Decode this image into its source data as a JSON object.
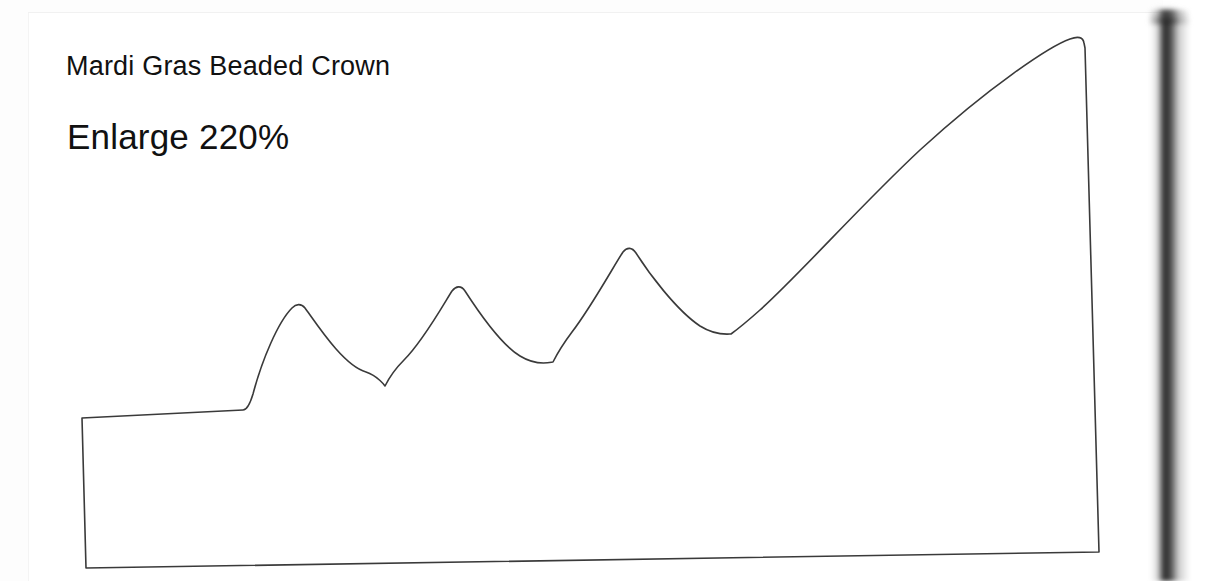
{
  "document": {
    "type": "scanned-pattern-page",
    "background_color": "#ffffff",
    "ink_color": "#3a3a3a",
    "text_color": "#111111"
  },
  "captions": {
    "title": "Mardi Gras Beaded Crown",
    "enlarge": "Enlarge 220%"
  },
  "pattern": {
    "name": "beaded-crown-outline",
    "description": "Crown template outline with three rounded points and a tall rising right side",
    "stroke_color": "#3a3a3a",
    "fill_color": "#ffffff",
    "path": "M 82 418 L 243 410 C 247 410 250 404 253 394 C 262 360 278 322 292 308 C 296 304 301 303 305 308 C 318 326 344 366 366 372 C 378 376 385 386 385 386 C 385 386 392 372 404 360 C 424 340 446 300 452 291 C 456 286 461 285 465 291 C 476 308 500 344 520 356 C 538 367 551 362 553 362 C 553 362 560 348 572 332 C 592 306 616 262 623 252 C 627 247 632 247 636 253 C 648 272 676 310 700 326 C 716 336 728 334 731 334 C 731 334 742 326 760 310 C 800 274 860 206 920 150 C 990 86 1050 46 1070 39 C 1078 36 1083 37 1084 43 L 1085 48 L 1099 552 L 86 568 Z",
    "anchors": {
      "top_left": [
        82,
        418
      ],
      "ledge_right": [
        243,
        410
      ],
      "peak_1": [
        300,
        304
      ],
      "valley_1": [
        385,
        386
      ],
      "peak_2": [
        460,
        286
      ],
      "valley_2": [
        553,
        362
      ],
      "peak_3": [
        630,
        247
      ],
      "valley_3": [
        731,
        334
      ],
      "apex_right": [
        1085,
        36
      ],
      "bottom_right": [
        1099,
        552
      ],
      "bottom_left": [
        86,
        568
      ]
    }
  },
  "page_artifacts": {
    "left_margin_label": "page-left-edge",
    "top_margin_label": "page-top-edge",
    "spine_shadow_label": "book-spine-shadow"
  }
}
